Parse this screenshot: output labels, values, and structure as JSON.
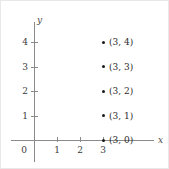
{
  "figure": {
    "background_color": "#ffffff",
    "border_color": "#e8e8e8",
    "axis_color": "#8a8a8a",
    "point_color": "#1a1a1a",
    "text_color": "#3a3a3a"
  },
  "chart_data": {
    "type": "scatter",
    "title": "",
    "xlabel": "x",
    "ylabel": "y",
    "xlim": [
      -0.95,
      5.1
    ],
    "ylim": [
      -0.75,
      5.0
    ],
    "grid": false,
    "legend": null,
    "x_ticks": [
      {
        "value": 0,
        "label": "0"
      },
      {
        "value": 1,
        "label": "1"
      },
      {
        "value": 2,
        "label": "2"
      },
      {
        "value": 3,
        "label": "3"
      }
    ],
    "y_ticks": [
      {
        "value": 1,
        "label": "1"
      },
      {
        "value": 2,
        "label": "2"
      },
      {
        "value": 3,
        "label": "3"
      },
      {
        "value": 4,
        "label": "4"
      }
    ],
    "points": [
      {
        "x": 3,
        "y": 4,
        "label": "(3, 4)"
      },
      {
        "x": 3,
        "y": 3,
        "label": "(3, 3)"
      },
      {
        "x": 3,
        "y": 2,
        "label": "(3, 2)"
      },
      {
        "x": 3,
        "y": 1,
        "label": "(3, 1)"
      },
      {
        "x": 3,
        "y": 0,
        "label": "(3, 0)"
      }
    ],
    "annotations": [
      "Vertical line x = 3 illustrated by five labelled lattice points"
    ]
  }
}
